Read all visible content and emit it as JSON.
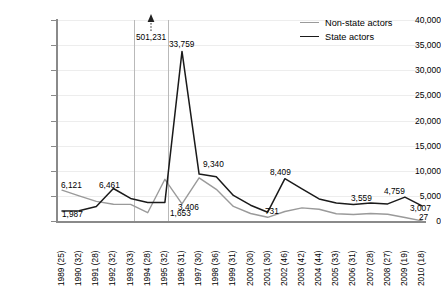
{
  "chart_data": {
    "type": "line",
    "title": "",
    "xlabel": "",
    "ylabel": "",
    "ylim": [
      0,
      40000
    ],
    "grid": true,
    "legend_position": "top-right",
    "categories": [
      "1989 (25)",
      "1990 (32)",
      "1991 (28)",
      "1992 (32)",
      "1993 (33)",
      "1994 (28)",
      "1995 (32)",
      "1996 (31)",
      "1997 (30)",
      "1998 (36)",
      "1999 (31)",
      "2000 (30)",
      "2001 (30)",
      "2002 (46)",
      "2003 (42)",
      "2004 (44)",
      "2005 (33)",
      "2006 (31)",
      "2007 (28)",
      "2008 (27)",
      "2009 (19)",
      "2010 (18)"
    ],
    "x": [
      1989,
      1990,
      1991,
      1992,
      1993,
      1994,
      1995,
      1996,
      1997,
      1998,
      1999,
      2000,
      2001,
      2002,
      2003,
      2004,
      2005,
      2006,
      2007,
      2008,
      2009,
      2010
    ],
    "ytick_labels": [
      "0",
      "5,000",
      "10,000",
      "15,000",
      "20,000",
      "25,000",
      "30,000",
      "35,000",
      "40,000"
    ],
    "ytick_values": [
      0,
      5000,
      10000,
      15000,
      20000,
      25000,
      30000,
      35000,
      40000
    ],
    "series": [
      {
        "name": "Non-state actors",
        "color": "#9a9a9a",
        "values": [
          6121,
          5000,
          3900,
          3350,
          3300,
          1653,
          8300,
          3406,
          8600,
          6300,
          2900,
          1500,
          731,
          1900,
          2600,
          2350,
          1450,
          1300,
          1500,
          1350,
          700,
          27
        ]
      },
      {
        "name": "State actors",
        "color": "#1a1a1a",
        "values": [
          1987,
          2050,
          2900,
          6461,
          4500,
          3700,
          3700,
          33759,
          9340,
          8800,
          5100,
          3150,
          1750,
          8409,
          6400,
          4400,
          3600,
          3300,
          3559,
          3400,
          4759,
          3007
        ]
      }
    ],
    "value_labels": [
      {
        "text": "6,121",
        "series": "Non-state actors",
        "x": 1989
      },
      {
        "text": "1,987",
        "series": "State actors",
        "x": 1989
      },
      {
        "text": "6,461",
        "series": "State actors",
        "x": 1992
      },
      {
        "text": "1,653",
        "series": "Non-state actors",
        "x": 1994
      },
      {
        "text": "33,759",
        "series": "State actors",
        "x": 1996
      },
      {
        "text": "3,406",
        "series": "Non-state actors",
        "x": 1996
      },
      {
        "text": "9,340",
        "series": "State actors",
        "x": 1997
      },
      {
        "text": "731",
        "series": "Non-state actors",
        "x": 2001
      },
      {
        "text": "8,409",
        "series": "State actors",
        "x": 2002
      },
      {
        "text": "3,559",
        "series": "State actors",
        "x": 2007
      },
      {
        "text": "4,759",
        "series": "State actors",
        "x": 2009
      },
      {
        "text": "3,007",
        "series": "State actors",
        "x": 2010
      },
      {
        "text": "27",
        "series": "Non-state actors",
        "x": 2010
      }
    ],
    "annotations": [
      {
        "text": "501,231",
        "x": 1994,
        "note": "off-scale value marked by upward arrow between two vertical rules"
      }
    ]
  },
  "legend": {
    "items": [
      {
        "label": "Non-state actors",
        "color": "#9a9a9a"
      },
      {
        "label": "State actors",
        "color": "#1a1a1a"
      }
    ]
  }
}
